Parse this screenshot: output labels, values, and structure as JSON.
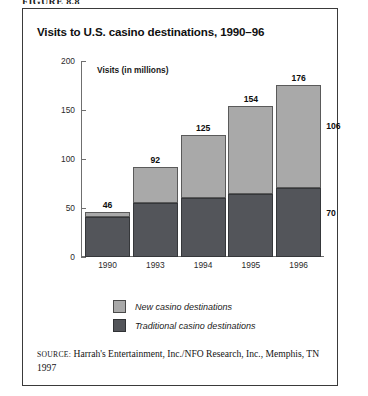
{
  "figure": {
    "caption": "FIGURE 8.8"
  },
  "chart_data": {
    "type": "bar",
    "subtype": "stacked",
    "title": "Visits to U.S. casino destinations, 1990–96",
    "subtitle": "Visits (in millions)",
    "xlabel": "",
    "ylabel": "",
    "categories": [
      "1990",
      "1993",
      "1994",
      "1995",
      "1996"
    ],
    "series": [
      {
        "name": "Traditional casino destinations",
        "color": "#53555a",
        "values": [
          41,
          55,
          60,
          64,
          70
        ]
      },
      {
        "name": "New casino destinations",
        "color": "#a9a9a9",
        "values": [
          5,
          37,
          65,
          90,
          106
        ]
      }
    ],
    "totals": [
      46,
      92,
      125,
      154,
      176
    ],
    "ylim": [
      0,
      200
    ],
    "yticks": [
      0,
      50,
      100,
      150,
      200
    ],
    "ytick_labels": [
      "0",
      "50",
      "100",
      "150",
      "200"
    ],
    "grid": false,
    "legend_position": "bottom"
  },
  "legend": {
    "items": [
      {
        "label": "New casino destinations",
        "color": "#a9a9a9"
      },
      {
        "label": "Traditional casino destinations",
        "color": "#53555a"
      }
    ]
  },
  "source": {
    "label": "SOURCE:",
    "text": " Harrah's Entertainment, Inc./NFO Research, Inc., Memphis, TN 1997"
  }
}
